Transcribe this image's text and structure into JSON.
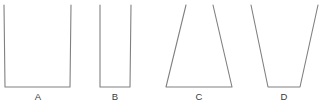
{
  "figure": {
    "type": "line-diagram",
    "width": 325,
    "height": 104,
    "background_color": "#ffffff",
    "stroke_color": "#808080",
    "stroke_width": 1.1,
    "label_color": "#3a3a3a"
  },
  "shapes": [
    {
      "id": "shape-a",
      "label": "A",
      "form": "wide straight-sided open container",
      "label_x": 38,
      "label_y": 92,
      "top_left_x": 4,
      "top_right_x": 71,
      "bottom_left_x": 5,
      "bottom_right_x": 70,
      "top_y": 5,
      "bottom_y": 87,
      "points": "4,5 5,87 70,87 71,5"
    },
    {
      "id": "shape-b",
      "label": "B",
      "form": "narrow straight-sided open container",
      "label_x": 115,
      "label_y": 92,
      "top_left_x": 100,
      "top_right_x": 131,
      "bottom_left_x": 100,
      "bottom_right_x": 130,
      "top_y": 5,
      "bottom_y": 87,
      "points": "100,5 100,87 130,87 131,5"
    },
    {
      "id": "shape-c",
      "label": "C",
      "form": "open container flaring outward toward the base",
      "label_x": 199,
      "label_y": 92,
      "top_left_x": 186,
      "top_right_x": 213,
      "bottom_left_x": 166,
      "bottom_right_x": 232,
      "top_y": 5,
      "bottom_y": 87,
      "points": "186,5 166,87 232,87 213,5"
    },
    {
      "id": "shape-d",
      "label": "D",
      "form": "open container tapering inward toward the base",
      "label_x": 284,
      "label_y": 92,
      "top_left_x": 251,
      "top_right_x": 318,
      "bottom_left_x": 268,
      "bottom_right_x": 300,
      "top_y": 5,
      "bottom_y": 87,
      "points": "251,5 268,87 300,87 318,5"
    }
  ]
}
